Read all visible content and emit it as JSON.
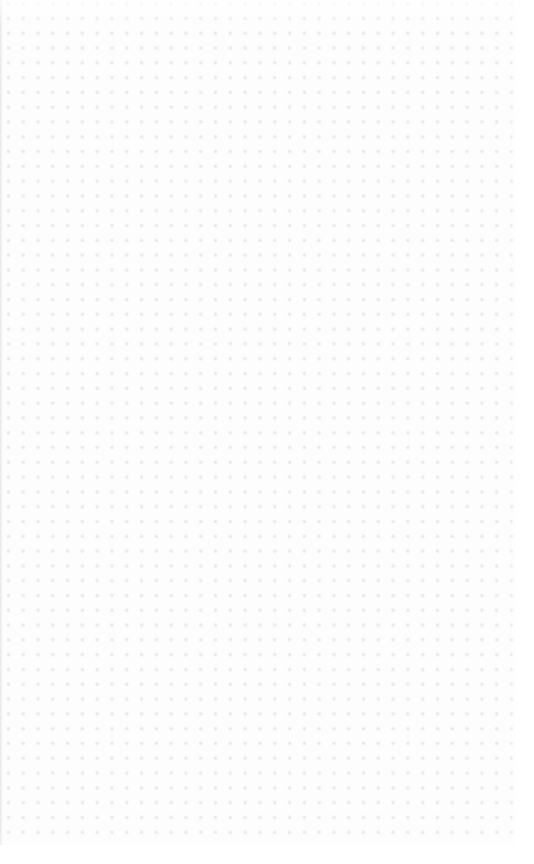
{
  "canvas": {
    "width": 534,
    "height": 864,
    "background_color": "#fdfdfe",
    "state": "empty",
    "empty_state_description": "Empty dot-grid canvas with no content",
    "grid": {
      "pattern": "dots",
      "dot_color": "#e4e4ea",
      "dot_radius_px": 0.7,
      "spacing_px": 14.8,
      "origin_x_px": 1,
      "origin_y_px": 11,
      "columns": 36,
      "rows": 57,
      "right_gutter_px": 18,
      "bottom_gutter_px": 19,
      "left_edge_clipped": true
    }
  },
  "content": {
    "items": [],
    "item_count": 0
  }
}
